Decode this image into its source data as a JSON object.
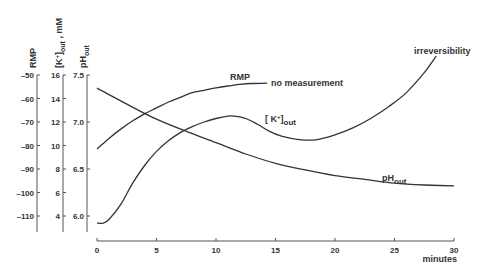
{
  "chart_data": {
    "type": "line",
    "title": "",
    "xlabel": "minutes",
    "x_axis": {
      "range": [
        0,
        30
      ],
      "ticks": [
        0,
        5,
        10,
        15,
        20,
        25,
        30
      ],
      "tick_labels": [
        "0",
        "5",
        "10",
        "15",
        "20",
        "25",
        "30"
      ]
    },
    "y_axes": [
      {
        "id": "rmp",
        "label": "RMP",
        "range": [
          -115,
          -50
        ],
        "ticks": [
          -50,
          -60,
          -70,
          -80,
          -90,
          -100,
          -110
        ],
        "tick_labels": [
          "-50",
          "-60",
          "-70",
          "-80",
          "-90",
          "-100",
          "-110"
        ]
      },
      {
        "id": "k",
        "label_main": "[K",
        "label_sup": "+",
        "label_close": "]",
        "label_sub": "out",
        "label_unit": " , mM",
        "range": [
          3,
          16
        ],
        "ticks": [
          16,
          14,
          12,
          10,
          8,
          6,
          4
        ],
        "tick_labels": [
          "16",
          "14",
          "12",
          "10",
          "8",
          "6",
          "4"
        ]
      },
      {
        "id": "ph",
        "label_main": "pH",
        "label_sub": "out",
        "range": [
          5.95,
          7.5
        ],
        "ticks": [
          7.5,
          7.0,
          6.5,
          6.0
        ],
        "tick_labels": [
          "7.5",
          "7.0",
          "6.5",
          "6.0"
        ]
      }
    ],
    "grid": false,
    "legend": "none",
    "series": [
      {
        "name": "RMP",
        "axis": "rmp",
        "unit": "mV",
        "x": [
          0,
          1,
          2,
          3,
          4,
          5,
          6,
          7,
          8,
          9,
          10,
          11,
          12,
          13,
          14.3
        ],
        "y": [
          -81.5,
          -77,
          -73,
          -69.5,
          -66.5,
          -64,
          -61.5,
          -59.5,
          -57.5,
          -56.5,
          -55.5,
          -54.7,
          -54,
          -53.6,
          -53.5
        ]
      },
      {
        "name": "[K+]out",
        "axis": "k",
        "unit": "mM",
        "x": [
          0,
          0.5,
          1,
          2,
          3,
          4,
          5,
          6,
          7,
          8,
          9,
          10,
          11,
          11.5,
          12.5,
          13.5,
          14.5,
          15.5,
          17,
          18.5,
          20,
          21.5,
          23,
          24.5,
          26,
          27.5,
          28.5
        ],
        "y": [
          3.4,
          3.4,
          3.7,
          5.0,
          6.8,
          8.3,
          9.5,
          10.4,
          11.1,
          11.6,
          12.0,
          12.3,
          12.5,
          12.5,
          12.3,
          11.8,
          11.2,
          10.8,
          10.5,
          10.5,
          10.9,
          11.5,
          12.3,
          13.3,
          14.5,
          16.2,
          17.6
        ]
      },
      {
        "name": "pHout",
        "axis": "ph",
        "unit": "pH",
        "x": [
          0,
          2.5,
          5,
          7.5,
          10,
          12.5,
          15,
          17.5,
          20,
          22.5,
          25,
          27.5,
          30
        ],
        "y": [
          7.36,
          7.19,
          7.03,
          6.9,
          6.78,
          6.66,
          6.56,
          6.49,
          6.43,
          6.39,
          6.35,
          6.33,
          6.32
        ]
      }
    ],
    "annotations": {
      "rmp_label": "RMP",
      "no_measurement": "no measurement",
      "irreversibility": "irreversibility",
      "k_label_main": "[ K",
      "k_label_sup": "+",
      "k_label_close": "]",
      "k_label_sub": "out",
      "ph_label_main": "pH",
      "ph_label_sub": "out"
    }
  }
}
